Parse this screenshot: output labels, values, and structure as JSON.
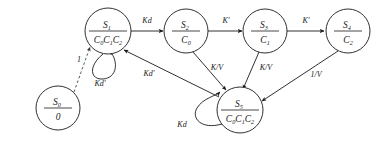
{
  "diagram": {
    "type": "state-transition-diagram",
    "title": "",
    "nodes": [
      {
        "id": "S0",
        "label": "S",
        "sub": "0",
        "denominator": "0",
        "cx": 58,
        "cy": 108,
        "r": 22
      },
      {
        "id": "S1",
        "label": "S",
        "sub": "1",
        "denominator": "C0C1C2",
        "cx": 108,
        "cy": 31,
        "r": 23
      },
      {
        "id": "S2",
        "label": "S",
        "sub": "2",
        "denominator": "C0",
        "cx": 186,
        "cy": 31,
        "r": 22
      },
      {
        "id": "S3",
        "label": "S",
        "sub": "3",
        "denominator": "C1",
        "cx": 265,
        "cy": 31,
        "r": 22
      },
      {
        "id": "S4",
        "label": "S",
        "sub": "4",
        "denominator": "C2",
        "cx": 348,
        "cy": 31,
        "r": 22
      },
      {
        "id": "S5",
        "label": "S",
        "sub": "5",
        "denominator": "C0C1C2",
        "cx": 240,
        "cy": 110,
        "r": 23
      }
    ],
    "edges": [
      {
        "id": "e-s0-s1",
        "from": "S0",
        "to": "S1",
        "label": "1",
        "style": "dashed",
        "label_x": 79,
        "label_y": 62
      },
      {
        "id": "e-s1-s2",
        "from": "S1",
        "to": "S2",
        "label": "Kd",
        "style": "solid",
        "label_x": 147,
        "label_y": 22
      },
      {
        "id": "e-s2-s3",
        "from": "S2",
        "to": "S3",
        "label": "K'",
        "style": "solid",
        "label_x": 226,
        "label_y": 22
      },
      {
        "id": "e-s3-s4",
        "from": "S3",
        "to": "S4",
        "label": "K'",
        "style": "solid",
        "label_x": 306,
        "label_y": 22
      },
      {
        "id": "e-s2-s5",
        "from": "S2",
        "to": "S5",
        "label": "K/V",
        "style": "solid",
        "label_x": 217,
        "label_y": 70
      },
      {
        "id": "e-s3-s5",
        "from": "S3",
        "to": "S5",
        "label": "K/V",
        "style": "solid",
        "label_x": 265,
        "label_y": 70
      },
      {
        "id": "e-s4-s5",
        "from": "S4",
        "to": "S5",
        "label": "1/V",
        "style": "solid",
        "label_x": 315,
        "label_y": 76
      },
      {
        "id": "e-s5-s1",
        "from": "S5",
        "to": "S1",
        "label": "Kd'",
        "style": "solid",
        "label_x": 148,
        "label_y": 75
      },
      {
        "id": "e-s1-loop",
        "from": "S1",
        "to": "S1",
        "label": "Kd'",
        "style": "self-loop",
        "label_x": 100,
        "label_y": 83
      },
      {
        "id": "e-s5-loop",
        "from": "S5",
        "to": "S5",
        "label": "Kd",
        "style": "self-loop",
        "label_x": 181,
        "label_y": 126
      }
    ]
  }
}
